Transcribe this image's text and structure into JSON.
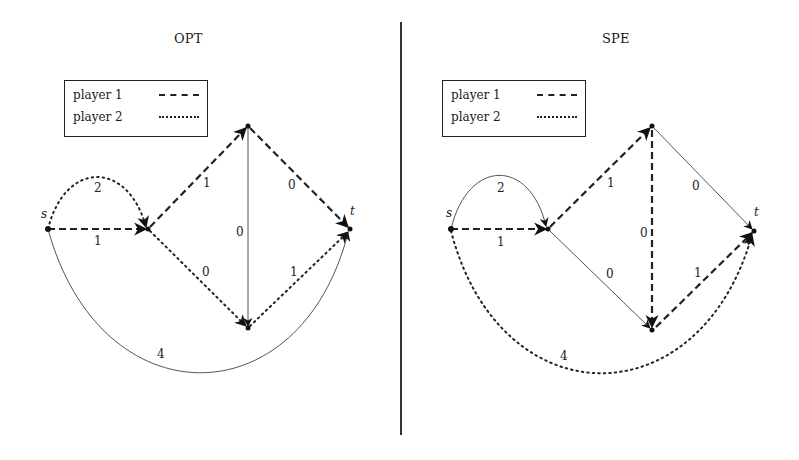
{
  "figure": {
    "panels": [
      {
        "id": "opt",
        "title": "OPT",
        "legend": {
          "items": [
            {
              "label": "player 1",
              "style": "dashed"
            },
            {
              "label": "player 2",
              "style": "dotted"
            }
          ]
        },
        "nodes": {
          "s": {
            "label": "s"
          },
          "t": {
            "label": "t"
          }
        },
        "edges": [
          {
            "from": "s",
            "to": "v1",
            "shape": "straight",
            "weight": "1",
            "style": "dashed",
            "player": "player 1"
          },
          {
            "from": "s",
            "to": "v1",
            "shape": "arc-up",
            "weight": "2",
            "style": "dotted",
            "player": "player 2"
          },
          {
            "from": "v1",
            "to": "top",
            "shape": "straight",
            "weight": "1",
            "style": "dashed",
            "player": "player 1"
          },
          {
            "from": "top",
            "to": "t",
            "shape": "straight",
            "weight": "0",
            "style": "dashed",
            "player": "player 1"
          },
          {
            "from": "top",
            "to": "bottom",
            "shape": "straight",
            "weight": "0",
            "style": "solid",
            "player": "none"
          },
          {
            "from": "v1",
            "to": "bottom",
            "shape": "straight",
            "weight": "0",
            "style": "dotted",
            "player": "player 2"
          },
          {
            "from": "bottom",
            "to": "t",
            "shape": "straight",
            "weight": "1",
            "style": "dotted",
            "player": "player 2"
          },
          {
            "from": "s",
            "to": "t",
            "shape": "arc-down",
            "weight": "4",
            "style": "solid",
            "player": "none"
          }
        ]
      },
      {
        "id": "spe",
        "title": "SPE",
        "legend": {
          "items": [
            {
              "label": "player 1",
              "style": "dashed"
            },
            {
              "label": "player 2",
              "style": "dotted"
            }
          ]
        },
        "nodes": {
          "s": {
            "label": "s"
          },
          "t": {
            "label": "t"
          }
        },
        "edges": [
          {
            "from": "s",
            "to": "v1",
            "shape": "straight",
            "weight": "1",
            "style": "dashed",
            "player": "player 1"
          },
          {
            "from": "s",
            "to": "v1",
            "shape": "arc-up",
            "weight": "2",
            "style": "solid",
            "player": "none"
          },
          {
            "from": "v1",
            "to": "top",
            "shape": "straight",
            "weight": "1",
            "style": "dashed",
            "player": "player 1"
          },
          {
            "from": "top",
            "to": "t",
            "shape": "straight",
            "weight": "0",
            "style": "solid",
            "player": "none"
          },
          {
            "from": "top",
            "to": "bottom",
            "shape": "straight",
            "weight": "0",
            "style": "dashed",
            "player": "player 1"
          },
          {
            "from": "v1",
            "to": "bottom",
            "shape": "straight",
            "weight": "0",
            "style": "solid",
            "player": "none"
          },
          {
            "from": "bottom",
            "to": "t",
            "shape": "straight",
            "weight": "1",
            "style": "dashed",
            "player": "player 1"
          },
          {
            "from": "s",
            "to": "t",
            "shape": "arc-down",
            "weight": "4",
            "style": "dotted",
            "player": "player 2"
          }
        ]
      }
    ]
  }
}
